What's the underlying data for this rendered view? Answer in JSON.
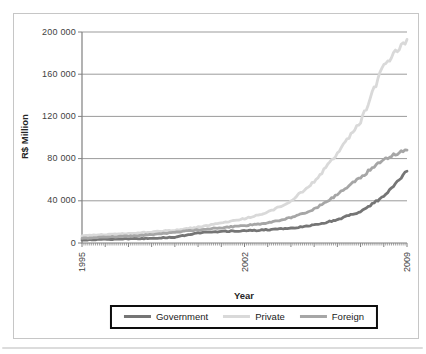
{
  "chart_data": {
    "type": "line",
    "title": "",
    "xlabel": "Year",
    "ylabel": "R$ Million",
    "x": [
      1995,
      1996,
      1997,
      1998,
      1999,
      2000,
      2001,
      2002,
      2003,
      2004,
      2005,
      2006,
      2007,
      2008,
      2009
    ],
    "x_tick_labels": [
      "1995",
      "2002",
      "2009"
    ],
    "x_tick_years": [
      1995,
      2002,
      2009
    ],
    "ylim": [
      0,
      200000
    ],
    "yticks": [
      0,
      40000,
      80000,
      120000,
      160000,
      200000
    ],
    "ytick_labels": [
      "0",
      "40 000",
      "80 000",
      "120 000",
      "160 000",
      "200 000"
    ],
    "grid": "horizontal",
    "legend_position": "bottom-center-boxed",
    "series": [
      {
        "name": "Government",
        "color": "#757575",
        "values": [
          3000,
          3500,
          4000,
          4500,
          5500,
          9500,
          11000,
          11500,
          12500,
          14000,
          17000,
          22000,
          30000,
          44000,
          68000
        ]
      },
      {
        "name": "Private",
        "color": "#d9d9d9",
        "values": [
          7000,
          8000,
          9000,
          10500,
          12000,
          15000,
          19000,
          23000,
          29000,
          40000,
          58000,
          85000,
          115000,
          168000,
          193000
        ]
      },
      {
        "name": "Foreign",
        "color": "#a6a6a6",
        "values": [
          4500,
          5500,
          6500,
          8000,
          10000,
          12500,
          14500,
          16500,
          19000,
          24000,
          32000,
          46000,
          62000,
          80000,
          88000
        ]
      }
    ],
    "style": {
      "gridline_color": "#9b9b9b",
      "axis_color": "#808080",
      "tick_color": "#8c8c8c",
      "text_color": "#3f3f3f",
      "legend_border_color": "#0d0d0d",
      "figure_border_color": "#c6c6c6",
      "line_width": 2.8
    }
  }
}
